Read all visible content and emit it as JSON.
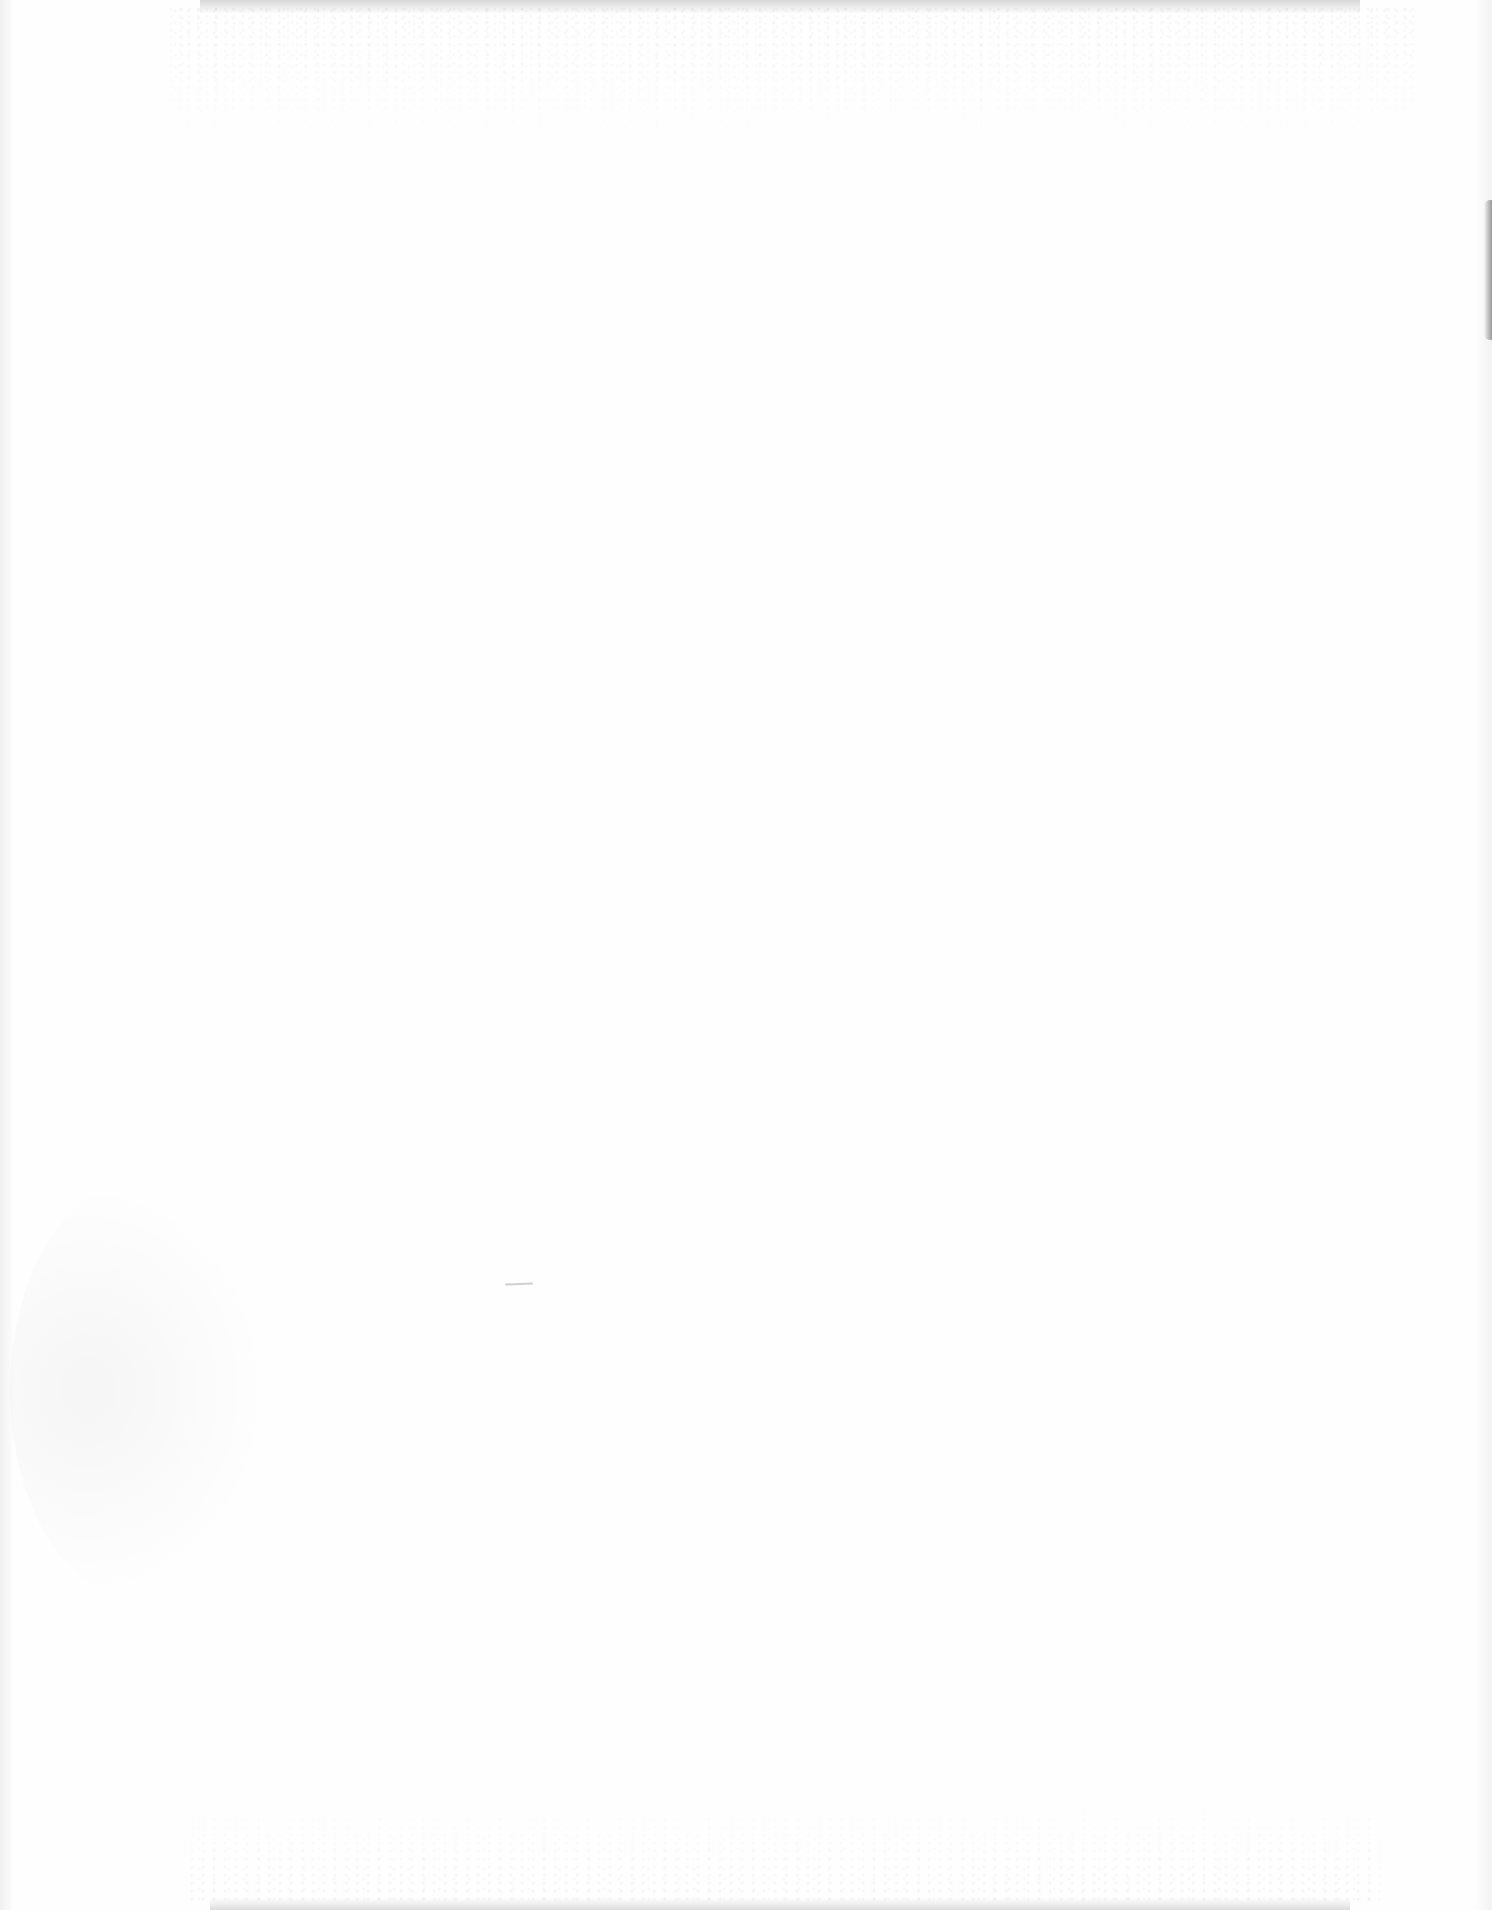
{
  "document": {
    "type": "blank scanned page",
    "text_content": [],
    "colors": {
      "paper": "#fefefe",
      "edge_shadow": "#d6d6d6",
      "right_edge_mark": "#9a9a9a"
    }
  }
}
